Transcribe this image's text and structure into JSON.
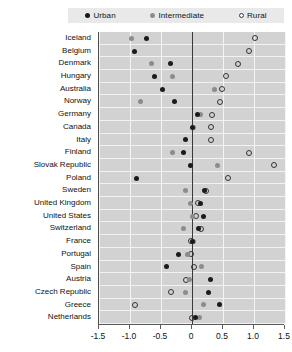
{
  "legend": {
    "items": [
      {
        "key": "urban",
        "label": "Urban",
        "marker": "filled-dark-circle",
        "color": "#1a1a1a"
      },
      {
        "key": "intermediate",
        "label": "Intermediate",
        "marker": "filled-gray-circle",
        "color": "#8e8e8e"
      },
      {
        "key": "rural",
        "label": "Rural",
        "marker": "open-circle",
        "color": "#ffffff"
      }
    ]
  },
  "axis": {
    "tick_labels": [
      "-1.5",
      "-1.0",
      "-0.5",
      "0",
      "0.5",
      "1.0",
      "1.5"
    ],
    "tick_values": [
      -1.5,
      -1.0,
      -0.5,
      0,
      0.5,
      1.0,
      1.5
    ],
    "min": -1.5,
    "max": 1.5
  },
  "chart_data": {
    "type": "scatter",
    "title": "",
    "subtitle": "",
    "xlabel": "",
    "ylabel": "",
    "xlim": [
      -1.5,
      1.5
    ],
    "grid": true,
    "legend_position": "top",
    "orientation": "horizontal",
    "zero_reference_line": 0,
    "categories": [
      "Iceland",
      "Belgium",
      "Denmark",
      "Hungary",
      "Australia",
      "Norway",
      "Germany",
      "Canada",
      "Italy",
      "Finland",
      "Slovak Republic",
      "Poland",
      "Sweden",
      "United Kingdom",
      "United States",
      "Switzerland",
      "France",
      "Portugal",
      "Spain",
      "Austria",
      "Czech Republic",
      "Greece",
      "Netherlands"
    ],
    "series": [
      {
        "name": "Urban",
        "marker": "filled-dark-circle",
        "color": "#1a1a1a",
        "values": [
          -0.74,
          -0.92,
          -0.34,
          -0.61,
          -0.47,
          -0.29,
          0.09,
          0.0,
          -0.1,
          -0.13,
          -0.02,
          -0.9,
          0.2,
          0.13,
          0.18,
          0.1,
          0.0,
          -0.21,
          -0.41,
          0.3,
          0.27,
          0.45,
          0.05
        ]
      },
      {
        "name": "Intermediate",
        "marker": "filled-gray-circle",
        "color": "#8e8e8e",
        "values": [
          -0.97,
          null,
          -0.65,
          -0.32,
          0.36,
          -0.83,
          0.14,
          0.02,
          null,
          -0.31,
          0.41,
          null,
          -0.1,
          -0.03,
          0.0,
          -0.13,
          0.02,
          -0.07,
          0.16,
          -0.04,
          -0.11,
          0.19,
          0.12
        ]
      },
      {
        "name": "Rural",
        "marker": "open-circle",
        "color": "#ffffff",
        "values": [
          1.02,
          0.92,
          0.74,
          0.55,
          0.48,
          0.45,
          0.32,
          0.31,
          0.3,
          0.92,
          1.32,
          0.58,
          0.22,
          0.1,
          0.06,
          0.15,
          -0.02,
          -0.01,
          0.04,
          -0.09,
          -0.34,
          -0.92,
          0.0
        ]
      }
    ]
  }
}
